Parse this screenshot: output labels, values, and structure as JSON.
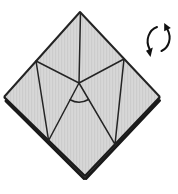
{
  "figure": {
    "type": "origami-step-diagram",
    "rotation_symbol_direction": "counterclockwise"
  },
  "colors": {
    "background": "#ffffff",
    "paper": "#d7d7d7",
    "paper_texture": "#cacaca",
    "line": "#242424",
    "edge_shadow": "#1a1a1a"
  },
  "diagram": {
    "canvas": {
      "width": 178,
      "height": 194
    },
    "outline_points": {
      "top": [
        80,
        12
      ],
      "right": [
        160,
        97
      ],
      "bottom": [
        85,
        176
      ],
      "left": [
        4,
        97
      ]
    },
    "key_points": {
      "center_apex": [
        79,
        83
      ],
      "left_flap_corner": [
        36,
        61
      ],
      "right_flap_corner": [
        124,
        59
      ],
      "lower_left_junction": [
        48.6,
        140.5
      ],
      "lower_right_junction": [
        115,
        144.4
      ]
    },
    "paths": {
      "paper": "M 80,12 L 160,97 L 85,176 L 4,97 Z",
      "upper_edges": "M 4,97 L 80,12 L 160,97",
      "lower_edges": "M 4,97 L 85,176 L 160,97",
      "edge_shadow_left": "M 6,101 L 84,178.5",
      "edge_shadow_right": "M 159.5,100.5 L 86,178.5",
      "fold_lines": "M 80.5,13 L 79,83 M 36,61 L 79,83 M 124,59 L 79,83 M 36,61 L 48.6,140.5 M 124,59 L 115,144.4 M 79,83 L 48.6,140.5 M 79,83 L 115,144.4",
      "angle_arc": "M 70.1,99.8 A 19 19 0 0 0 88.5,99.5",
      "rotate_left_arc": "M 157,27 C 149,30 145,40 149.5,49",
      "rotate_left_head": "150.5,57 152.8,47.6 146,50.8",
      "rotate_right_arc": "M 161.5,51 C 169,47.5 172,38 167.5,29.5",
      "rotate_right_head": "164.2,23 170.8,28.1 164.2,31.3"
    }
  }
}
